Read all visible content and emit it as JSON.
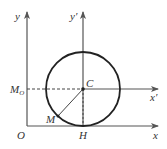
{
  "diagram": {
    "labels": {
      "y": "y",
      "y_prime": "y′",
      "x": "x",
      "x_prime": "x′",
      "origin": "O",
      "center": "C",
      "point_m": "M",
      "point_m0_main": "M",
      "point_m0_sub": "O",
      "point_h": "H"
    },
    "colors": {
      "axis": "#555555",
      "circle": "#222222",
      "dashed": "#444444",
      "text": "#333333"
    }
  }
}
